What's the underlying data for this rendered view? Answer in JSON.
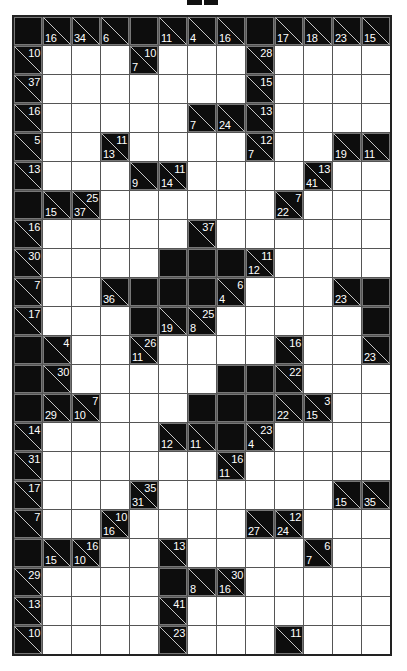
{
  "puzzle": {
    "type": "kakuro",
    "columns": 13,
    "rows": 22,
    "colors": {
      "black": "#0d0d0d",
      "white": "#ffffff",
      "grid_line": "#555555",
      "clue_text": "#ffffff"
    },
    "legend": {
      "W": "white entry cell",
      "B": "black blocked cell",
      "d": "down clue (bottom-left)",
      "a": "across clue (top-right)"
    },
    "grid": [
      [
        "B",
        {
          "d": "16"
        },
        {
          "d": "34"
        },
        {
          "d": "6"
        },
        "B",
        {
          "d": "11"
        },
        {
          "d": "4"
        },
        {
          "d": "16"
        },
        "B",
        {
          "d": "17"
        },
        {
          "d": "18"
        },
        {
          "d": "23"
        },
        {
          "d": "15"
        }
      ],
      [
        {
          "a": "10"
        },
        "W",
        "W",
        "W",
        {
          "d": "7",
          "a": "10"
        },
        "W",
        "W",
        "W",
        {
          "a": "28"
        },
        "W",
        "W",
        "W",
        "W"
      ],
      [
        {
          "a": "37"
        },
        "W",
        "W",
        "W",
        "W",
        "W",
        "W",
        "W",
        {
          "a": "15"
        },
        "W",
        "W",
        "W",
        "W"
      ],
      [
        {
          "a": "16"
        },
        "W",
        "W",
        "W",
        "W",
        "W",
        {
          "d": "7"
        },
        {
          "d": "24"
        },
        {
          "a": "13"
        },
        "W",
        "W",
        "W",
        "W"
      ],
      [
        {
          "a": "5"
        },
        "W",
        "W",
        {
          "d": "13",
          "a": "11"
        },
        "W",
        "W",
        "W",
        "W",
        {
          "d": "7",
          "a": "12"
        },
        "W",
        "W",
        {
          "d": "19"
        },
        {
          "d": "11"
        }
      ],
      [
        {
          "a": "13"
        },
        "W",
        "W",
        "W",
        {
          "d": "9"
        },
        {
          "d": "14",
          "a": "11"
        },
        "W",
        "W",
        "W",
        "W",
        {
          "d": "41",
          "a": "13"
        },
        "W",
        "W"
      ],
      [
        "B",
        {
          "d": "15"
        },
        {
          "d": "37",
          "a": "25"
        },
        "W",
        "W",
        "W",
        "W",
        "W",
        "W",
        {
          "d": "22",
          "a": "7"
        },
        "W",
        "W",
        "W"
      ],
      [
        {
          "a": "16"
        },
        "W",
        "W",
        "W",
        "W",
        "W",
        {
          "a": "37"
        },
        "W",
        "W",
        "W",
        "W",
        "W",
        "W"
      ],
      [
        {
          "a": "30"
        },
        "W",
        "W",
        "W",
        "W",
        "B",
        "B",
        "B",
        {
          "d": "12",
          "a": "11"
        },
        "W",
        "W",
        "W",
        "W"
      ],
      [
        {
          "a": "7"
        },
        "W",
        "W",
        {
          "d": "36"
        },
        "B",
        "B",
        "B",
        {
          "d": "4",
          "a": "6"
        },
        "W",
        "W",
        "W",
        {
          "d": "23"
        },
        "B"
      ],
      [
        {
          "a": "17"
        },
        "W",
        "W",
        "W",
        "B",
        {
          "d": "19"
        },
        {
          "d": "8",
          "a": "25"
        },
        "W",
        "W",
        "W",
        "W",
        "W",
        "B"
      ],
      [
        "B",
        {
          "a": "4"
        },
        "W",
        "W",
        {
          "d": "11",
          "a": "26"
        },
        "W",
        "W",
        "W",
        "W",
        {
          "a": "16"
        },
        "W",
        "W",
        {
          "d": "23"
        }
      ],
      [
        "B",
        {
          "a": "30"
        },
        "W",
        "W",
        "W",
        "W",
        "W",
        "B",
        "B",
        {
          "a": "22"
        },
        "W",
        "W",
        "W"
      ],
      [
        "B",
        {
          "d": "29"
        },
        {
          "d": "10",
          "a": "7"
        },
        "W",
        "W",
        "W",
        "B",
        "B",
        "B",
        {
          "d": "22"
        },
        {
          "d": "15",
          "a": "3"
        },
        "W",
        "W"
      ],
      [
        {
          "a": "14"
        },
        "W",
        "W",
        "W",
        "W",
        {
          "d": "12"
        },
        {
          "d": "11"
        },
        "B",
        {
          "d": "4",
          "a": "23"
        },
        "W",
        "W",
        "W",
        "W"
      ],
      [
        {
          "a": "31"
        },
        "W",
        "W",
        "W",
        "W",
        "W",
        "W",
        {
          "d": "11",
          "a": "16"
        },
        "W",
        "W",
        "W",
        "W",
        "W"
      ],
      [
        {
          "a": "17"
        },
        "W",
        "W",
        "W",
        {
          "d": "31",
          "a": "35"
        },
        "W",
        "W",
        "W",
        "W",
        "W",
        "W",
        {
          "d": "15"
        },
        {
          "d": "35"
        }
      ],
      [
        {
          "a": "7"
        },
        "W",
        "W",
        {
          "d": "16",
          "a": "10"
        },
        "W",
        "W",
        "W",
        "W",
        {
          "d": "27"
        },
        {
          "d": "24",
          "a": "12"
        },
        "W",
        "W",
        "W"
      ],
      [
        "B",
        {
          "d": "15"
        },
        {
          "d": "10",
          "a": "16"
        },
        "W",
        "W",
        {
          "a": "13"
        },
        "W",
        "W",
        "W",
        "W",
        {
          "d": "7",
          "a": "6"
        },
        "W",
        "W"
      ],
      [
        {
          "a": "29"
        },
        "W",
        "W",
        "W",
        "W",
        "B",
        {
          "d": "8"
        },
        {
          "d": "16",
          "a": "30"
        },
        "W",
        "W",
        "W",
        "W",
        "W"
      ],
      [
        {
          "a": "13"
        },
        "W",
        "W",
        "W",
        "W",
        {
          "a": "41"
        },
        "W",
        "W",
        "W",
        "W",
        "W",
        "W",
        "W"
      ],
      [
        {
          "a": "10"
        },
        "W",
        "W",
        "W",
        "W",
        {
          "a": "23"
        },
        "W",
        "W",
        "W",
        {
          "a": "11"
        },
        "W",
        "W",
        "W"
      ]
    ]
  }
}
